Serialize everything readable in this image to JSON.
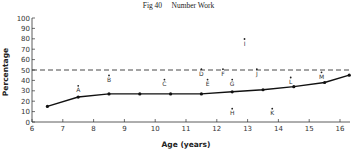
{
  "chart_data": {
    "type": "line",
    "title": "Fig 40     Number Work",
    "xlabel": "Age (years)",
    "ylabel": "Percentage",
    "xlim": [
      6,
      16.4
    ],
    "ylim": [
      0,
      100
    ],
    "x_ticks": [
      6,
      7,
      8,
      9,
      10,
      11,
      12,
      13,
      14,
      15,
      16
    ],
    "y_ticks": [
      0,
      10,
      20,
      30,
      40,
      50,
      60,
      70,
      80,
      90,
      100
    ],
    "grid": false,
    "reference_line": {
      "y": 50,
      "style": "dashed"
    },
    "series": [
      {
        "name": "Curve",
        "x": [
          6.5,
          7.5,
          8.5,
          9.5,
          10.5,
          11.5,
          12.5,
          13.5,
          14.5,
          15.5,
          16.3
        ],
        "values": [
          15,
          24,
          27,
          27,
          27,
          27,
          29,
          31,
          34,
          38,
          45
        ]
      }
    ],
    "annotations": [
      {
        "label": "A",
        "x": 7.5,
        "y": 30
      },
      {
        "label": "B",
        "x": 8.5,
        "y": 40
      },
      {
        "label": "C",
        "x": 10.3,
        "y": 36
      },
      {
        "label": "D",
        "x": 11.5,
        "y": 46
      },
      {
        "label": "E",
        "x": 11.7,
        "y": 36
      },
      {
        "label": "F",
        "x": 12.2,
        "y": 46
      },
      {
        "label": "G",
        "x": 12.5,
        "y": 36
      },
      {
        "label": "H",
        "x": 12.5,
        "y": 8
      },
      {
        "label": "I",
        "x": 12.9,
        "y": 75
      },
      {
        "label": "J",
        "x": 13.3,
        "y": 46
      },
      {
        "label": "K",
        "x": 13.8,
        "y": 8
      },
      {
        "label": "L",
        "x": 14.4,
        "y": 38
      },
      {
        "label": "M",
        "x": 15.4,
        "y": 43
      }
    ]
  }
}
